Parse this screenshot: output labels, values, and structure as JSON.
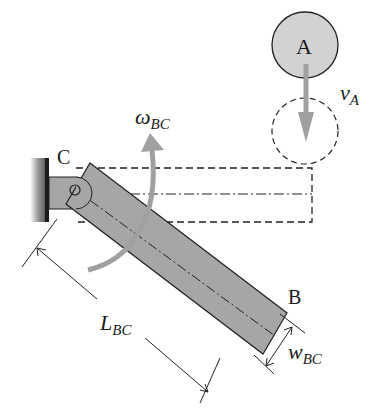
{
  "diagram": {
    "labels": {
      "point_a": "A",
      "point_b": "B",
      "point_c": "C",
      "velocity_symbol": "v",
      "velocity_sub": "A",
      "omega_symbol": "ω",
      "omega_sub": "BC",
      "length_symbol": "L",
      "length_sub": "BC",
      "width_symbol": "w",
      "width_sub": "BC"
    },
    "colors": {
      "bar_fill": "#a6a6a6",
      "ball_fill": "#d2d2d2",
      "arrow_gray": "#a0a0a0",
      "line": "#222222",
      "wall": "#1a1a1a"
    }
  }
}
